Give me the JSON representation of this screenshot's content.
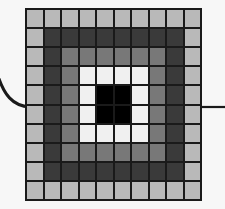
{
  "figure": {
    "grid": {
      "rows": 10,
      "cols": 10,
      "gridline_color": "#1a1a1a",
      "gridline_width_px": 2,
      "background_color": "#f7f7f7"
    },
    "palette": {
      "ring_1_light_gray": "#b9b9b9",
      "ring_2_dark_gray": "#3a3a3a",
      "ring_3_mid_gray": "#787878",
      "ring_4_white": "#f0f0f0",
      "center_black": "#000000"
    },
    "legend_names": [
      "light-gray",
      "dark-gray",
      "mid-gray",
      "white",
      "black"
    ],
    "connectors": {
      "left_label": "curved-connector-line",
      "right_label": "straight-connector-line",
      "stroke_color": "#1a1a1a"
    }
  },
  "chart_data": {
    "type": "heatmap",
    "xlabel": "",
    "ylabel": "",
    "categories_x": [
      "1",
      "2",
      "3",
      "4",
      "5",
      "6",
      "7",
      "8",
      "9",
      "10"
    ],
    "categories_y": [
      "1",
      "2",
      "3",
      "4",
      "5",
      "6",
      "7",
      "8",
      "9",
      "10"
    ],
    "value_labels": {
      "0": "light-gray",
      "1": "dark-gray",
      "2": "mid-gray",
      "3": "white",
      "4": "black"
    },
    "value_colors": {
      "0": "#b9b9b9",
      "1": "#3a3a3a",
      "2": "#787878",
      "3": "#f0f0f0",
      "4": "#000000"
    },
    "grid": true,
    "values": [
      [
        0,
        0,
        0,
        0,
        0,
        0,
        0,
        0,
        0,
        0
      ],
      [
        0,
        1,
        1,
        1,
        1,
        1,
        1,
        1,
        1,
        0
      ],
      [
        0,
        1,
        2,
        2,
        2,
        2,
        2,
        2,
        1,
        0
      ],
      [
        0,
        1,
        2,
        3,
        3,
        3,
        3,
        2,
        1,
        0
      ],
      [
        0,
        1,
        2,
        3,
        4,
        4,
        3,
        2,
        1,
        0
      ],
      [
        0,
        1,
        2,
        3,
        4,
        4,
        3,
        2,
        1,
        0
      ],
      [
        0,
        1,
        2,
        3,
        3,
        3,
        3,
        2,
        1,
        0
      ],
      [
        0,
        1,
        2,
        2,
        2,
        2,
        2,
        2,
        1,
        0
      ],
      [
        0,
        1,
        1,
        1,
        1,
        1,
        1,
        1,
        1,
        0
      ],
      [
        0,
        0,
        0,
        0,
        0,
        0,
        0,
        0,
        0,
        0
      ]
    ]
  }
}
